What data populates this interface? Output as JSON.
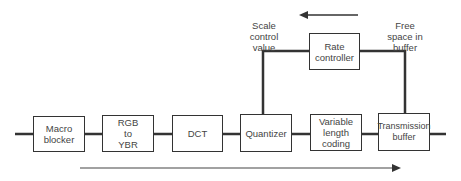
{
  "diagram": {
    "type": "block-diagram",
    "blocks": [
      {
        "id": "macro-blocker",
        "label": "Macro\nblocker"
      },
      {
        "id": "rgb-to-ybr",
        "label": "RGB\nto\nYBR"
      },
      {
        "id": "dct",
        "label": "DCT"
      },
      {
        "id": "quantizer",
        "label": "Quantizer"
      },
      {
        "id": "variable-length-coding",
        "label": "Variable\nlength\ncoding"
      },
      {
        "id": "transmission-buffer",
        "label": "Transmission\nbuffer"
      },
      {
        "id": "rate-controller",
        "label": "Rate\ncontroller"
      }
    ],
    "labels": {
      "scale_control_value": "Scale\ncontrol\nvalue",
      "free_space_in_buffer": "Free\nspace in\nbuffer"
    },
    "arrows": {
      "feedback_direction": "right-to-left",
      "data_flow_direction": "left-to-right"
    },
    "colors": {
      "stroke": "#333333",
      "text": "#444444",
      "background": "#ffffff"
    }
  }
}
